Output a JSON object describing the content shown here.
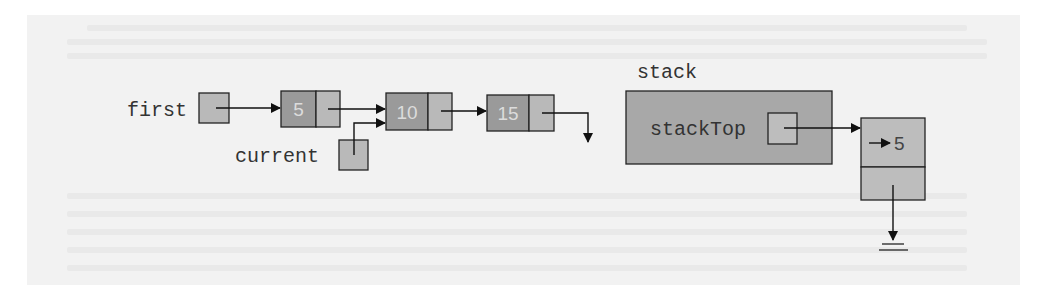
{
  "diagram": {
    "type": "linked-list-to-stack",
    "colors": {
      "page_background": "#ffffff",
      "panel_background": "#f2f2f2",
      "pointer_box_fill": "#b9b9b9",
      "data_cell_fill": "#9a9a9a",
      "data_text_color": "#dcdcdc",
      "stack_struct_fill": "#a8a8a8",
      "stack_node_fill": "#bdbdbd",
      "line_color": "#111111",
      "label_color": "#333333"
    },
    "linked_list": {
      "head_label": "first",
      "cursor_label": "current",
      "nodes": [
        {
          "value": "5"
        },
        {
          "value": "10"
        },
        {
          "value": "15"
        }
      ],
      "cursor_points_to_index": 1,
      "tail_next": "null"
    },
    "stack": {
      "name_label": "stack",
      "member_label": "stackTop",
      "top_node": {
        "info": "5",
        "info_prefix_arrow": "→",
        "link": "null"
      }
    }
  }
}
